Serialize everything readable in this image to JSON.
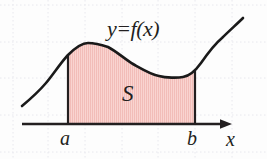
{
  "figure": {
    "name": "area-under-curve",
    "background_color": "#fdfdfd",
    "grid": {
      "visible": true,
      "style": "dotted",
      "color": "#e9e9ef",
      "vertical_x": [
        13,
        48,
        85,
        122,
        158,
        195,
        232
      ],
      "horizontal_y": [
        5,
        42,
        78,
        115,
        152
      ]
    },
    "curve": {
      "name": "function-curve",
      "color": "#1a1a1a",
      "stroke_width": 2.6,
      "points": [
        [
          22,
          106
        ],
        [
          33,
          96
        ],
        [
          46,
          83
        ],
        [
          58,
          68
        ],
        [
          68,
          55
        ],
        [
          78,
          47
        ],
        [
          88,
          43
        ],
        [
          97,
          43
        ],
        [
          108,
          47
        ],
        [
          120,
          55
        ],
        [
          133,
          64
        ],
        [
          146,
          71
        ],
        [
          159,
          76
        ],
        [
          172,
          78
        ],
        [
          183,
          77
        ],
        [
          192,
          72
        ],
        [
          201,
          63
        ],
        [
          211,
          51
        ],
        [
          222,
          38
        ],
        [
          233,
          27
        ],
        [
          243,
          18
        ]
      ]
    },
    "region": {
      "name": "shaded-area",
      "fill_color": "#f7cdc9",
      "hatch_color": "#f0b5b0",
      "hatch_spacing": 2,
      "left_x": 68,
      "right_x": 195,
      "baseline_y": 124,
      "boundary_color": "#231f20",
      "boundary_width": 2.2
    },
    "axis": {
      "name": "x-axis",
      "color": "#231f20",
      "stroke_width": 2.4,
      "y": 124,
      "start_x": 22,
      "end_x": 232,
      "arrow": true
    },
    "labels": {
      "function": "y=f(x)",
      "region": "S",
      "lower_bound": "a",
      "upper_bound": "b",
      "axis": "x"
    }
  }
}
